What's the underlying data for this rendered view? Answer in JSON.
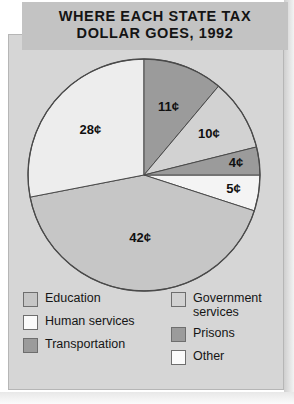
{
  "title": {
    "line1": "WHERE EACH STATE TAX",
    "line2": "DOLLAR GOES, 1992"
  },
  "colors": {
    "panel_bg": "#d6d6d6",
    "banner_bg": "#c3c3c3",
    "outline": "#4a4a4a",
    "education": "#c6c6c6",
    "human_services": "#ededed",
    "transportation": "#9b9b9b",
    "government_services": "#d2d2d2",
    "prisons": "#9b9b9b",
    "other": "#f4f4f4"
  },
  "chart_data": {
    "type": "pie",
    "title": "WHERE EACH STATE TAX DOLLAR GOES, 1992",
    "unit": "¢",
    "categories": [
      "Education",
      "Human services",
      "Transportation",
      "Government services",
      "Prisons",
      "Other"
    ],
    "values": [
      42,
      28,
      11,
      10,
      4,
      5
    ],
    "labels": [
      "42¢",
      "28¢",
      "11¢",
      "10¢",
      "4¢",
      "5¢"
    ],
    "slice_colors": [
      "#c6c6c6",
      "#ededed",
      "#9b9b9b",
      "#d2d2d2",
      "#9b9b9b",
      "#f4f4f4"
    ],
    "legend_position": "bottom",
    "total": 100
  },
  "slices": [
    {
      "name": "other",
      "label": "5¢",
      "value": 5,
      "color": "#f4f4f4",
      "start": 0,
      "end": 18,
      "label_r": 0.78
    },
    {
      "name": "education",
      "label": "42¢",
      "value": 42,
      "color": "#c6c6c6",
      "start": 18,
      "end": 169,
      "label_r": 0.55
    },
    {
      "name": "human-services",
      "label": "28¢",
      "value": 28,
      "color": "#ededed",
      "start": 169,
      "end": 270,
      "label_r": 0.6
    },
    {
      "name": "transportation",
      "label": "11¢",
      "value": 11,
      "color": "#9b9b9b",
      "start": 270,
      "end": 310,
      "label_r": 0.62
    },
    {
      "name": "government-services",
      "label": "10¢",
      "value": 10,
      "color": "#d2d2d2",
      "start": 310,
      "end": 346,
      "label_r": 0.66
    },
    {
      "name": "prisons",
      "label": "4¢",
      "value": 4,
      "color": "#9b9b9b",
      "start": 346,
      "end": 360,
      "label_r": 0.8
    }
  ],
  "legend": {
    "left": [
      {
        "key": "education",
        "label": "Education",
        "color": "#c6c6c6"
      },
      {
        "key": "human-services",
        "label": "Human services",
        "color": "#fbfbfb"
      },
      {
        "key": "transportation",
        "label": "Transportation",
        "color": "#9b9b9b"
      }
    ],
    "right": [
      {
        "key": "government-services",
        "label": "Government\nservices",
        "color": "#d2d2d2"
      },
      {
        "key": "prisons",
        "label": "Prisons",
        "color": "#9b9b9b"
      },
      {
        "key": "other",
        "label": "Other",
        "color": "#fbfbfb"
      }
    ]
  }
}
